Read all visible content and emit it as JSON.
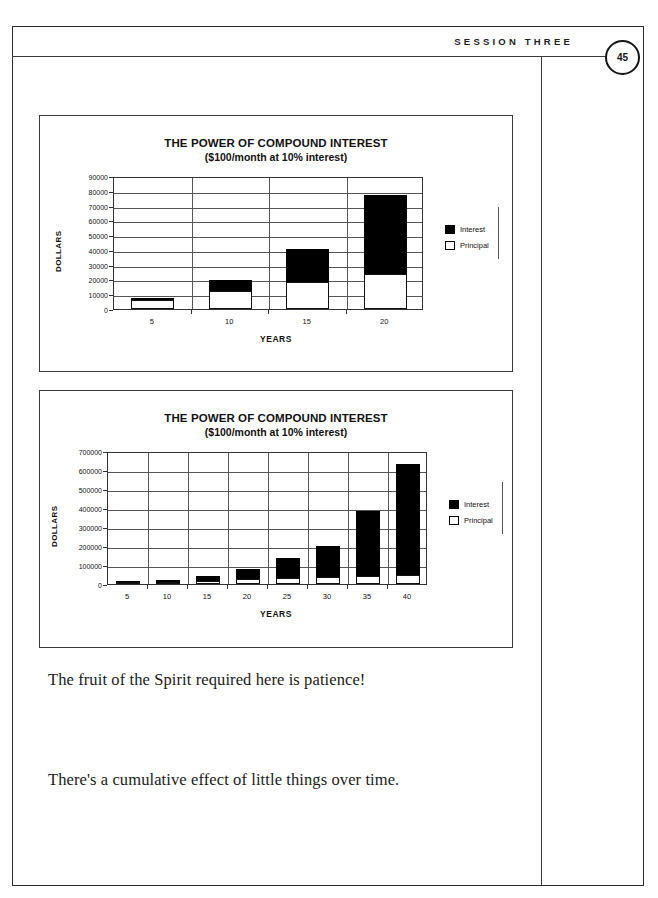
{
  "header": {
    "session_label": "SESSION THREE",
    "page_number": "45"
  },
  "charts": [
    {
      "title": "THE POWER OF COMPOUND INTEREST",
      "subtitle": "($100/month at 10% interest)",
      "ylabel": "DOLLARS",
      "xlabel": "YEARS",
      "legend": [
        {
          "label": "Interest",
          "color": "#000000"
        },
        {
          "label": "Principal",
          "color": "#ffffff"
        }
      ]
    },
    {
      "title": "THE POWER OF COMPOUND INTEREST",
      "subtitle": "($100/month at 10% interest)",
      "ylabel": "DOLLARS",
      "xlabel": "YEARS",
      "legend": [
        {
          "label": "Interest",
          "color": "#000000"
        },
        {
          "label": "Principal",
          "color": "#ffffff"
        }
      ]
    }
  ],
  "body": {
    "line1": "The fruit of the Spirit required here is patience!",
    "line2": "There's a cumulative effect of little things over time."
  },
  "chart_data": [
    {
      "type": "bar",
      "stacked": true,
      "title": "THE POWER OF COMPOUND INTEREST",
      "subtitle": "($100/month at 10% interest)",
      "xlabel": "YEARS",
      "ylabel": "DOLLARS",
      "categories": [
        "5",
        "10",
        "15",
        "20"
      ],
      "yticks": [
        0,
        10000,
        20000,
        30000,
        40000,
        50000,
        60000,
        70000,
        80000,
        90000
      ],
      "ylim": [
        0,
        90000
      ],
      "grid": true,
      "legend_position": "right",
      "series": [
        {
          "name": "Principal",
          "color": "#ffffff",
          "values": [
            6000,
            12000,
            18000,
            24000
          ]
        },
        {
          "name": "Interest",
          "color": "#000000",
          "values": [
            1800,
            7800,
            22500,
            53500
          ]
        }
      ],
      "totals": [
        7800,
        19800,
        40500,
        77500
      ]
    },
    {
      "type": "bar",
      "stacked": true,
      "title": "THE POWER OF COMPOUND INTEREST",
      "subtitle": "($100/month at 10% interest)",
      "xlabel": "YEARS",
      "ylabel": "DOLLARS",
      "categories": [
        "5",
        "10",
        "15",
        "20",
        "25",
        "30",
        "35",
        "40"
      ],
      "yticks": [
        0,
        100000,
        200000,
        300000,
        400000,
        500000,
        600000,
        700000
      ],
      "ylim": [
        0,
        700000
      ],
      "grid": true,
      "legend_position": "right",
      "series": [
        {
          "name": "Principal",
          "color": "#ffffff",
          "values": [
            6000,
            12000,
            18000,
            24000,
            30000,
            36000,
            42000,
            48000
          ]
        },
        {
          "name": "Interest",
          "color": "#000000",
          "values": [
            1800,
            7800,
            22500,
            53500,
            108000,
            166000,
            341000,
            586000
          ]
        }
      ],
      "totals": [
        7800,
        19800,
        40500,
        77500,
        138000,
        202000,
        383000,
        634000
      ]
    }
  ]
}
